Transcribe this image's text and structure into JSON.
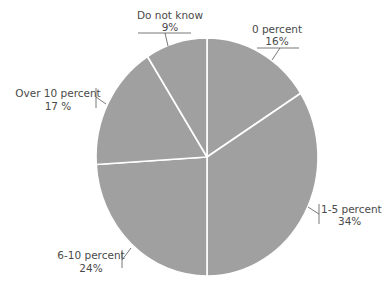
{
  "chart_data": {
    "type": "pie",
    "title": "",
    "categories": [
      "0 percent",
      "1-5 percent",
      "6-10 percent",
      "Over 10 percent",
      "Do not know"
    ],
    "values": [
      16,
      34,
      24,
      17,
      9
    ],
    "value_labels": [
      "16%",
      "34%",
      "24%",
      "17 %",
      "9%"
    ],
    "start_angle_deg": 0,
    "direction": "clockwise",
    "slice_color": "#a0a0a0",
    "separator_color": "#ffffff",
    "legend": "none",
    "labels_position": "outside with leader lines"
  },
  "labels": {
    "zero": {
      "name": "0 percent",
      "value": "16%"
    },
    "one5": {
      "name": "1-5 percent",
      "value": "34%"
    },
    "six10": {
      "name": "6-10 percent",
      "value": "24%"
    },
    "over10": {
      "name": "Over 10 percent",
      "value": "17 %"
    },
    "dnk": {
      "name": "Do not know",
      "value": "9%"
    }
  }
}
